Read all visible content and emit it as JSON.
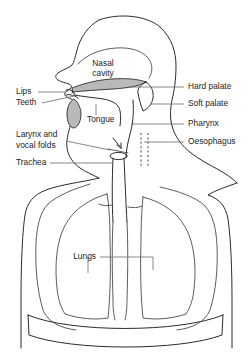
{
  "diagram": {
    "background_color": "#ffffff",
    "outline_color": "#2b2b2b",
    "leader_color": "#6a6a6a",
    "tissue_fill_color": "#b9b9b9"
  },
  "labels": {
    "nasal_cavity_line1": "Nasal",
    "nasal_cavity_line2": "cavity",
    "tongue": "Tongue",
    "lips": "Lips",
    "teeth": "Teeth",
    "larynx_line1": "Larynx and",
    "larynx_line2": "vocal folds",
    "trachea": "Trachea",
    "hard_palate": "Hard palate",
    "soft_palate": "Soft palate",
    "pharynx": "Pharynx",
    "oesophagus": "Oesophagus",
    "lungs": "Lungs"
  },
  "structures": [
    {
      "name": "nasal-cavity",
      "side": "interior"
    },
    {
      "name": "hard-palate",
      "side": "right"
    },
    {
      "name": "soft-palate",
      "side": "right"
    },
    {
      "name": "pharynx",
      "side": "right"
    },
    {
      "name": "oesophagus",
      "side": "right"
    },
    {
      "name": "lips",
      "side": "left"
    },
    {
      "name": "teeth",
      "side": "left"
    },
    {
      "name": "tongue",
      "side": "interior"
    },
    {
      "name": "larynx-and-vocal-folds",
      "side": "left"
    },
    {
      "name": "trachea",
      "side": "left"
    },
    {
      "name": "lungs",
      "side": "interior"
    }
  ]
}
